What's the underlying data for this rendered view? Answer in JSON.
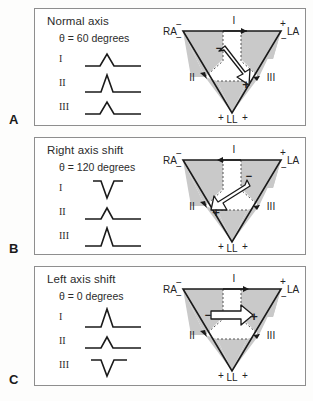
{
  "figure": {
    "title_semantic": "Einthoven triangle cardiac axis deviation diagram",
    "panel_letters": [
      "A",
      "B",
      "C"
    ]
  },
  "colors": {
    "panel_border": "#8e8e8e",
    "shaded_sector": "#c9c9c9",
    "line": "#1a1a1a",
    "background": "#ffffff",
    "text": "#222222"
  },
  "panels": [
    {
      "letter": "A",
      "title": "Normal axis",
      "theta": "θ = 60 degrees",
      "axis_degrees": 60,
      "leads": [
        {
          "name": "I",
          "label": "I",
          "deflection": "positive",
          "amplitude": "medium"
        },
        {
          "name": "II",
          "label": "II",
          "deflection": "positive",
          "amplitude": "tall"
        },
        {
          "name": "III",
          "label": "III",
          "deflection": "positive",
          "amplitude": "medium"
        }
      ],
      "triangle": {
        "vertices": [
          {
            "name": "RA",
            "label": "RA",
            "signs": [
              "−",
              "−"
            ]
          },
          {
            "name": "LA",
            "label": "LA",
            "signs": [
              "+",
              "−"
            ]
          },
          {
            "name": "LL",
            "label": "LL",
            "signs": [
              "+",
              "+"
            ]
          }
        ],
        "lead_axes": [
          {
            "label": "I",
            "position": "top"
          },
          {
            "label": "II",
            "position": "left"
          },
          {
            "label": "III",
            "position": "right"
          }
        ],
        "vector_origin_sign": "−",
        "vector_tip_sign": "+",
        "vector_direction": "down-right"
      }
    },
    {
      "letter": "B",
      "title": "Right axis shift",
      "theta": "θ = 120 degrees",
      "axis_degrees": 120,
      "leads": [
        {
          "name": "I",
          "label": "I",
          "deflection": "negative",
          "amplitude": "medium"
        },
        {
          "name": "II",
          "label": "II",
          "deflection": "positive",
          "amplitude": "small"
        },
        {
          "name": "III",
          "label": "III",
          "deflection": "positive",
          "amplitude": "tall"
        }
      ],
      "triangle": {
        "vertices": [
          {
            "name": "RA",
            "label": "RA",
            "signs": [
              "−",
              "−"
            ]
          },
          {
            "name": "LA",
            "label": "LA",
            "signs": [
              "+",
              "−"
            ]
          },
          {
            "name": "LL",
            "label": "LL",
            "signs": [
              "+",
              "+"
            ]
          }
        ],
        "lead_axes": [
          {
            "label": "I",
            "position": "top"
          },
          {
            "label": "II",
            "position": "left"
          },
          {
            "label": "III",
            "position": "right"
          }
        ],
        "vector_origin_sign": "−",
        "vector_tip_sign": "+",
        "vector_direction": "down-left"
      }
    },
    {
      "letter": "C",
      "title": "Left axis shift",
      "theta": "θ = 0 degrees",
      "axis_degrees": 0,
      "leads": [
        {
          "name": "I",
          "label": "I",
          "deflection": "positive",
          "amplitude": "tall"
        },
        {
          "name": "II",
          "label": "II",
          "deflection": "positive",
          "amplitude": "small"
        },
        {
          "name": "III",
          "label": "III",
          "deflection": "negative",
          "amplitude": "medium"
        }
      ],
      "triangle": {
        "vertices": [
          {
            "name": "RA",
            "label": "RA",
            "signs": [
              "−",
              "−"
            ]
          },
          {
            "name": "LA",
            "label": "LA",
            "signs": [
              "+",
              "−"
            ]
          },
          {
            "name": "LL",
            "label": "LL",
            "signs": [
              "+",
              "+"
            ]
          }
        ],
        "lead_axes": [
          {
            "label": "I",
            "position": "top"
          },
          {
            "label": "II",
            "position": "left"
          },
          {
            "label": "III",
            "position": "right"
          }
        ],
        "vector_origin_sign": "−",
        "vector_tip_sign": "+",
        "vector_direction": "right"
      }
    }
  ]
}
